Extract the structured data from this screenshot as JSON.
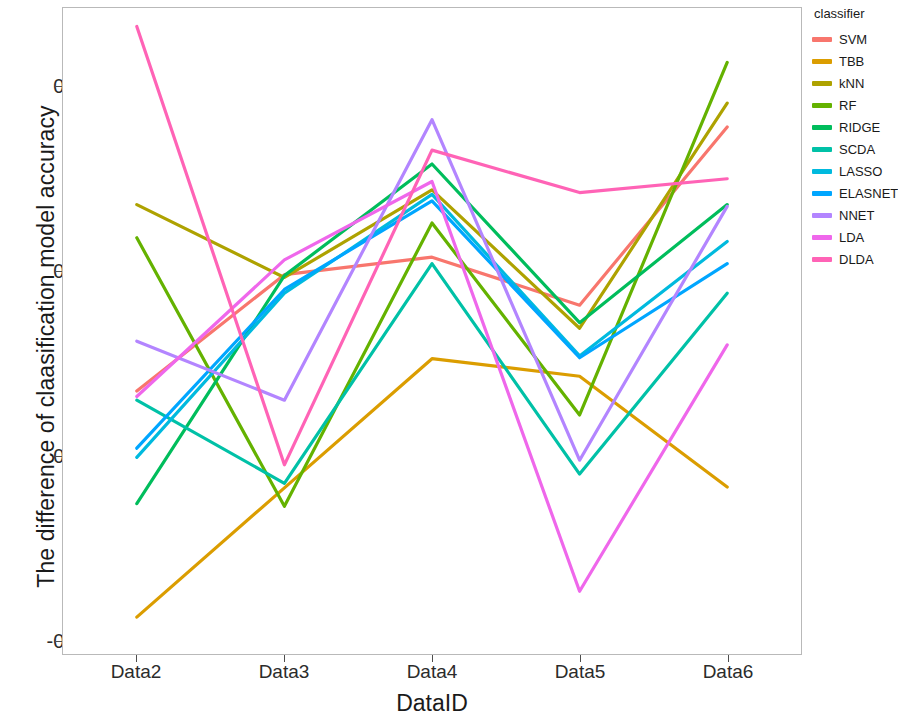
{
  "chart_data": {
    "type": "line",
    "title": "",
    "xlabel": "DataID",
    "ylabel": "The difference of claasification model accuracy",
    "categories": [
      "Data2",
      "Data3",
      "Data4",
      "Data5",
      "Data6"
    ],
    "x_tick_labels": [
      "Data2",
      "Data3",
      "Data4",
      "Data5",
      "Data6"
    ],
    "y_tick_labels": [
      "-0.2",
      "0.0",
      "0.2",
      "0.4"
    ],
    "y_tick_values": [
      -0.2,
      0.0,
      0.2,
      0.4
    ],
    "ylim": [
      -0.215,
      0.485
    ],
    "grid": false,
    "legend_position": "right",
    "legend_title": "classifier",
    "series": [
      {
        "name": "SVM",
        "color": "#F8766D",
        "values": [
          0.07,
          0.196,
          0.215,
          0.163,
          0.356
        ]
      },
      {
        "name": "TBB",
        "color": "#DB9D00",
        "values": [
          -0.175,
          -0.035,
          0.105,
          0.086,
          -0.034
        ]
      },
      {
        "name": "kNN",
        "color": "#AEA200",
        "values": [
          0.272,
          0.193,
          0.288,
          0.138,
          0.382
        ]
      },
      {
        "name": "RF",
        "color": "#64B200",
        "values": [
          0.236,
          -0.055,
          0.252,
          0.044,
          0.426
        ]
      },
      {
        "name": "RIDGE",
        "color": "#00BD5C",
        "values": [
          -0.052,
          0.195,
          0.316,
          0.144,
          0.272
        ]
      },
      {
        "name": "SCDA",
        "color": "#00C1A7",
        "values": [
          0.06,
          -0.03,
          0.208,
          -0.02,
          0.176
        ]
      },
      {
        "name": "LASSO",
        "color": "#00BADE",
        "values": [
          -0.002,
          0.176,
          0.283,
          0.108,
          0.232
        ]
      },
      {
        "name": "ELASNET",
        "color": "#00A6FF",
        "values": [
          0.008,
          0.18,
          0.276,
          0.106,
          0.208
        ]
      },
      {
        "name": "NNET",
        "color": "#B385FF",
        "values": [
          0.124,
          0.06,
          0.364,
          -0.005,
          0.27
        ]
      },
      {
        "name": "LDA",
        "color": "#EF67EB",
        "values": [
          0.064,
          0.212,
          0.297,
          -0.147,
          0.12
        ]
      },
      {
        "name": "DLDA",
        "color": "#FF63B6",
        "values": [
          0.465,
          -0.01,
          0.331,
          0.285,
          0.3
        ]
      }
    ]
  },
  "legend": {
    "title": "classifier",
    "items": [
      {
        "label": "SVM"
      },
      {
        "label": "TBB"
      },
      {
        "label": "kNN"
      },
      {
        "label": "RF"
      },
      {
        "label": "RIDGE"
      },
      {
        "label": "SCDA"
      },
      {
        "label": "LASSO"
      },
      {
        "label": "ELASNET"
      },
      {
        "label": "NNET"
      },
      {
        "label": "LDA"
      },
      {
        "label": "DLDA"
      }
    ]
  },
  "axes": {
    "x_title": "DataID",
    "y_title": "The difference of claasification model accuracy"
  }
}
